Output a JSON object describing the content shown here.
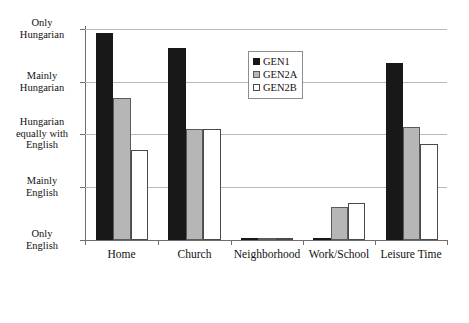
{
  "chart_data": {
    "type": "bar",
    "title": "",
    "xlabel": "",
    "ylabel": "",
    "grid": true,
    "legend_position": "top-center",
    "categories": [
      "Home",
      "Church",
      "Neighborhood",
      "Work/School",
      "Leisure Time"
    ],
    "y_tick_labels": [
      "Only\nHungarian",
      "Mainly\nHungarian",
      "Hungarian\nequally with\nEnglish",
      "Mainly\nEnglish",
      "Only\nEnglish"
    ],
    "y_scale": {
      "levels": [
        "Only English",
        "Mainly English",
        "Hungarian equally with English",
        "Mainly Hungarian",
        "Only Hungarian"
      ],
      "min": 1,
      "max": 5
    },
    "series": [
      {
        "name": "GEN1",
        "color": "#181818",
        "values": [
          4.92,
          4.65,
          1.0,
          1.0,
          4.35
        ]
      },
      {
        "name": "GEN2A",
        "color": "#b6b6b6",
        "values": [
          3.7,
          3.1,
          1.0,
          1.62,
          3.15
        ]
      },
      {
        "name": "GEN2B",
        "color": "#ffffff",
        "values": [
          2.7,
          3.1,
          1.0,
          1.7,
          2.83
        ]
      }
    ]
  },
  "y_axis": {
    "tick_1": {
      "line1": "Only",
      "line2": "Hungarian"
    },
    "tick_2": {
      "line1": "Mainly",
      "line2": "Hungarian"
    },
    "tick_3": {
      "line1": "Hungarian",
      "line2": "equally with",
      "line3": "English"
    },
    "tick_4": {
      "line1": "Mainly",
      "line2": "English"
    },
    "tick_5": {
      "line1": "Only",
      "line2": "English"
    }
  },
  "x_axis": {
    "labels": [
      "Home",
      "Church",
      "Neighborhood",
      "Work/School",
      "Leisure Time"
    ]
  },
  "legend": {
    "items": [
      {
        "label": "GEN1"
      },
      {
        "label": "GEN2A"
      },
      {
        "label": "GEN2B"
      }
    ]
  }
}
